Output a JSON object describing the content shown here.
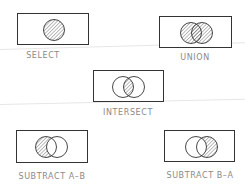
{
  "colors": {
    "stroke": "#333333",
    "hatch": "#555555",
    "label": "#8a8a8a"
  },
  "operations": [
    {
      "id": "select",
      "label": "SELECT",
      "shape": "single-circle-hatched"
    },
    {
      "id": "union",
      "label": "UNION",
      "shape": "both-circles-hatched"
    },
    {
      "id": "intersect",
      "label": "INTERSECT",
      "shape": "overlap-hatched"
    },
    {
      "id": "subtract-a-b",
      "label": "SUBTRACT A–B",
      "shape": "left-only-hatched"
    },
    {
      "id": "subtract-b-a",
      "label": "SUBTRACT B–A",
      "shape": "right-only-hatched"
    }
  ]
}
